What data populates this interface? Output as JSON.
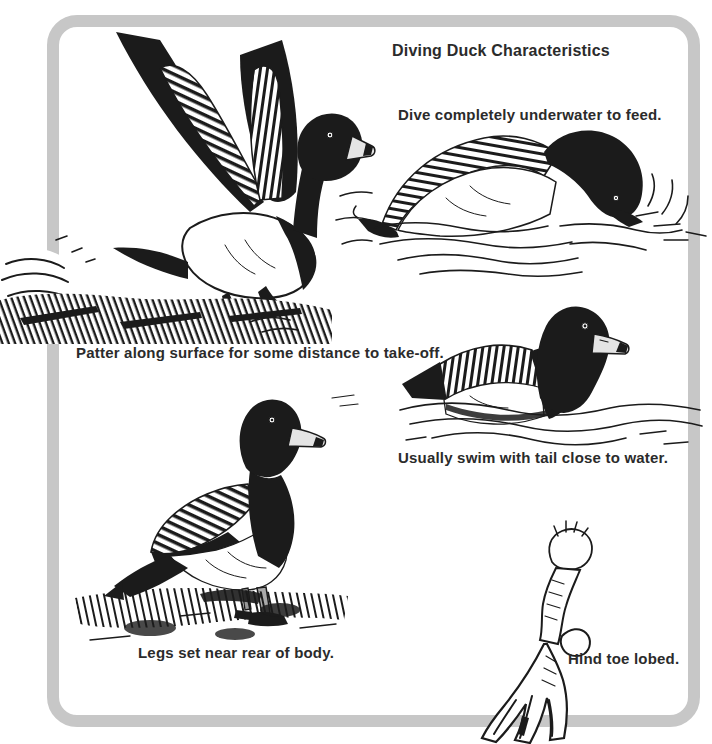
{
  "page": {
    "title": "Diving Duck Characteristics"
  },
  "captions": {
    "dive": "Dive completely underwater to feed.",
    "patter": "Patter along surface for some distance to take-off.",
    "swim": "Usually swim with tail close to water.",
    "legs_rear": "Legs set near rear of body.",
    "hind_toe": "Hind toe lobed."
  },
  "illustrations": [
    {
      "name": "duck-taking-off-illustration"
    },
    {
      "name": "duck-diving-illustration"
    },
    {
      "name": "duck-swimming-illustration"
    },
    {
      "name": "duck-standing-illustration"
    },
    {
      "name": "lobed-foot-illustration"
    }
  ],
  "colors": {
    "frame": "#c7c7c7",
    "ink": "#1b1b1b",
    "paper": "#ffffff",
    "text": "#2b2b2b",
    "bill": "#e4e4e4"
  }
}
